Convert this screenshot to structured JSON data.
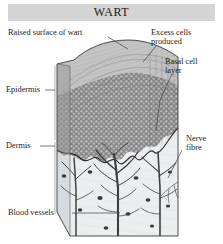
{
  "figure": {
    "title": "WART",
    "title_bar_color": "#d4d4d4",
    "background": "#ffffff",
    "view": "3D cut-away block diagram"
  },
  "labels": {
    "raised_surface": "Raised surface of wart",
    "excess_cells": "Excess cells\nproduced",
    "basal_layer": "Basal cell\nlayer",
    "epidermis": "Epidermis",
    "dermis": "Dermis",
    "nerve_fibre": "Nerve\nfibre",
    "blood_vessels": "Blood vessels"
  },
  "anatomy": {
    "layers": [
      {
        "name": "epidermis",
        "fill": "#8f8f8f"
      },
      {
        "name": "dermis",
        "fill": "#e9ecef"
      }
    ],
    "structures": [
      "wart surface elevation",
      "basal cell layer",
      "blood vessels",
      "nerve fibre"
    ]
  },
  "colors": {
    "ink": "#1b1b1b",
    "leader": "#555555",
    "epidermis_dark": "#6e6e6e",
    "dermis_light": "#e6eaec",
    "vessel": "#4a4a4a",
    "block_side": "#c9cdd0"
  }
}
